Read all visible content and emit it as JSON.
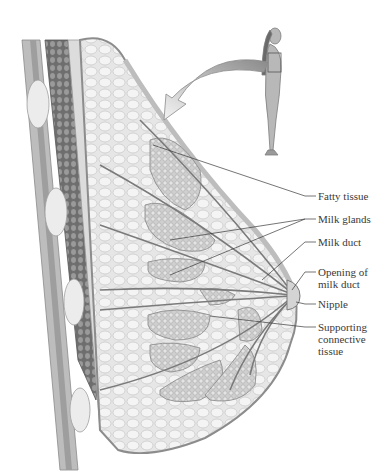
{
  "diagram": {
    "inset": "standing female figure with box indicating breast region",
    "labels": [
      {
        "id": "fatty-tissue",
        "text": "Fatty tissue",
        "x": 318,
        "y": 191
      },
      {
        "id": "milk-glands",
        "text": "Milk glands",
        "x": 318,
        "y": 214
      },
      {
        "id": "milk-duct",
        "text": "Milk duct",
        "x": 318,
        "y": 237
      },
      {
        "id": "opening-of-milk-duct",
        "text": "Opening of\nmilk duct",
        "x": 318,
        "y": 266
      },
      {
        "id": "nipple",
        "text": "Nipple",
        "x": 318,
        "y": 299
      },
      {
        "id": "supporting-connective-tissue",
        "text": "Supporting\nconnective\ntissue",
        "x": 318,
        "y": 322
      }
    ]
  }
}
